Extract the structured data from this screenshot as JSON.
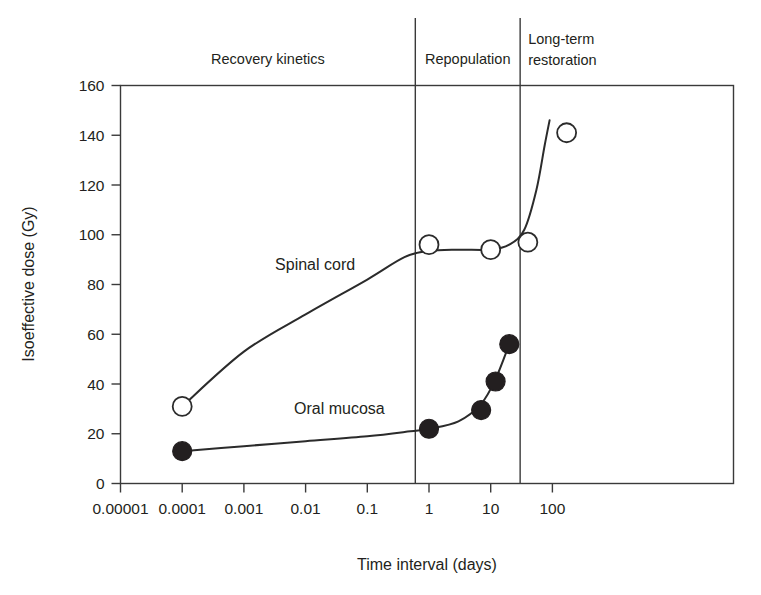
{
  "chart_data": {
    "type": "scatter",
    "title": "",
    "xlabel": "Time interval (days)",
    "ylabel": "Isoeffective dose (Gy)",
    "xscale": "log",
    "yscale": "linear",
    "xlim": [
      1e-05,
      300
    ],
    "ylim": [
      0,
      160
    ],
    "xticks": [
      1e-05,
      0.0001,
      0.001,
      0.01,
      0.1,
      1,
      10,
      100
    ],
    "xtick_labels": [
      "0.00001",
      "0.0001",
      "0.001",
      "0.01",
      "0.1",
      "1",
      "10",
      "100"
    ],
    "yticks": [
      0,
      20,
      40,
      60,
      80,
      100,
      120,
      140,
      160
    ],
    "ytick_labels": [
      "0",
      "20",
      "40",
      "60",
      "80",
      "100",
      "120",
      "140",
      "160"
    ],
    "grid": false,
    "legend_position": "inline-annotations",
    "series": [
      {
        "name": "Spinal cord",
        "marker": "open-circle",
        "label_x": 0.0032,
        "label_y": 86,
        "points": [
          {
            "x": 0.0001,
            "y": 31
          },
          {
            "x": 1.0,
            "y": 96
          },
          {
            "x": 10.0,
            "y": 94
          },
          {
            "x": 40.0,
            "y": 97
          },
          {
            "x": 170.0,
            "y": 141
          }
        ],
        "curve": [
          {
            "x": 0.0001,
            "y": 31
          },
          {
            "x": 0.001,
            "y": 53
          },
          {
            "x": 0.01,
            "y": 68
          },
          {
            "x": 0.1,
            "y": 82
          },
          {
            "x": 0.4,
            "y": 91
          },
          {
            "x": 1.0,
            "y": 93.5
          },
          {
            "x": 3.0,
            "y": 94
          },
          {
            "x": 10.0,
            "y": 94
          },
          {
            "x": 20.0,
            "y": 96
          },
          {
            "x": 35.0,
            "y": 102
          },
          {
            "x": 55.0,
            "y": 118
          },
          {
            "x": 75.0,
            "y": 136
          },
          {
            "x": 90.0,
            "y": 146
          }
        ]
      },
      {
        "name": "Oral mucosa",
        "marker": "filled-circle",
        "label_x": 0.0065,
        "label_y": 28,
        "points": [
          {
            "x": 0.0001,
            "y": 13
          },
          {
            "x": 1.0,
            "y": 22
          },
          {
            "x": 7.0,
            "y": 29.5
          },
          {
            "x": 12.0,
            "y": 41
          },
          {
            "x": 20.0,
            "y": 56
          }
        ],
        "curve": [
          {
            "x": 0.0001,
            "y": 13
          },
          {
            "x": 0.001,
            "y": 15
          },
          {
            "x": 0.01,
            "y": 17
          },
          {
            "x": 0.1,
            "y": 19
          },
          {
            "x": 0.5,
            "y": 21
          },
          {
            "x": 1.0,
            "y": 22
          },
          {
            "x": 3.0,
            "y": 25
          },
          {
            "x": 7.0,
            "y": 32
          },
          {
            "x": 12.0,
            "y": 42
          },
          {
            "x": 20.0,
            "y": 56
          }
        ]
      }
    ],
    "zones": [
      {
        "label": "Recovery kinetics",
        "x_start": 1e-05,
        "x_end": 0.6,
        "lines": [
          "Recovery kinetics"
        ]
      },
      {
        "label": "Repopulation",
        "x_start": 0.6,
        "x_end": 30,
        "lines": [
          "Repopulation"
        ]
      },
      {
        "label": "Long-term restoration",
        "x_start": 30,
        "x_end": 300,
        "lines": [
          "Long-term",
          "restoration"
        ]
      }
    ],
    "zone_dividers": [
      0.6,
      30
    ],
    "colors": {
      "axis": "#3a3a3a",
      "curve": "#2b2b2b",
      "text": "#231f20",
      "marker_fill_open": "#ffffff",
      "marker_fill_closed": "#231f20",
      "background": "#ffffff"
    }
  }
}
